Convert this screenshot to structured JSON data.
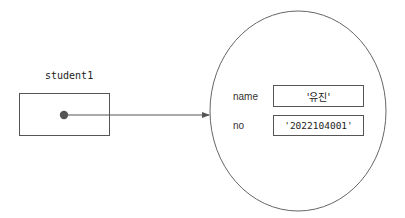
{
  "variable": {
    "name": "student1"
  },
  "object": {
    "fields": [
      {
        "name": "name",
        "value": "'유진'"
      },
      {
        "name": "no",
        "value": "'2022104001'"
      }
    ]
  },
  "colors": {
    "stroke": "#555555",
    "dot": "#555555",
    "background": "#ffffff"
  }
}
